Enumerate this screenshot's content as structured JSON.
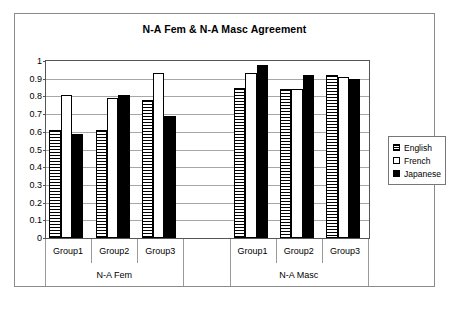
{
  "chart_data": {
    "type": "bar",
    "title": "N-A Fem & N-A Masc Agreement",
    "xlabel": "",
    "ylabel": "",
    "ylim": [
      0,
      1
    ],
    "ytick_labels": [
      "1",
      "0.9",
      "0.8",
      "0.7",
      "0.6",
      "0.5",
      "0.4",
      "0.3",
      "0.2",
      "0.1",
      "0"
    ],
    "ytick_values": [
      1,
      0.9,
      0.8,
      0.7,
      0.6,
      0.5,
      0.4,
      0.3,
      0.2,
      0.1,
      0
    ],
    "grid": true,
    "legend_position": "right",
    "panels": [
      {
        "label": "N-A Fem",
        "categories": [
          "Group1",
          "Group2",
          "Group3"
        ]
      },
      {
        "label": "N-A Masc",
        "categories": [
          "Group1",
          "Group2",
          "Group3"
        ]
      }
    ],
    "categories": [
      "N-A Fem / Group1",
      "N-A Fem / Group2",
      "N-A Fem / Group3",
      "N-A Masc / Group1",
      "N-A Masc / Group2",
      "N-A Masc / Group3"
    ],
    "series": [
      {
        "name": "English",
        "fill": "horizontal-stripes",
        "values": [
          0.61,
          0.61,
          0.78,
          0.845,
          0.84,
          0.92
        ]
      },
      {
        "name": "French",
        "fill": "white",
        "values": [
          0.81,
          0.79,
          0.93,
          0.935,
          0.84,
          0.91
        ]
      },
      {
        "name": "Japanese",
        "fill": "black",
        "values": [
          0.59,
          0.81,
          0.69,
          0.975,
          0.92,
          0.9
        ]
      }
    ]
  },
  "legend": {
    "items": [
      {
        "label": "English"
      },
      {
        "label": "French"
      },
      {
        "label": "Japanese"
      }
    ]
  },
  "colors": {
    "frame": "#8a8a8a",
    "axis": "#555555",
    "gridline": "#a7a7a7",
    "bar_outline": "#000000",
    "japanese_fill": "#000000",
    "french_fill": "#ffffff",
    "background": "#ffffff"
  }
}
